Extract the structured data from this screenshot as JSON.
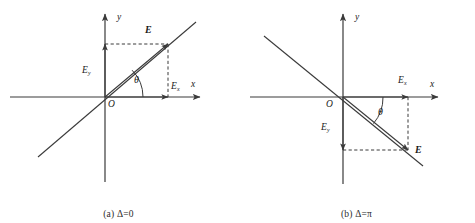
{
  "figure": {
    "stroke_color": "#3a3a3a",
    "panels": [
      {
        "id": "a",
        "caption": "(a) Δ=0",
        "axes": {
          "x_label": "x",
          "y_label": "y",
          "origin_label": "O"
        },
        "angle_label": "θ",
        "vector_label": "E",
        "component_x_label": "E",
        "component_x_sub": "x",
        "component_y_label": "E",
        "component_y_sub": "y",
        "line_slope": "positive",
        "e_vector_quadrant": "first"
      },
      {
        "id": "b",
        "caption": "(b) Δ=π",
        "axes": {
          "x_label": "x",
          "y_label": "y",
          "origin_label": "O"
        },
        "angle_label": "θ",
        "vector_label": "E",
        "component_x_label": "E",
        "component_x_sub": "x",
        "component_y_label": "E",
        "component_y_sub": "y",
        "line_slope": "negative",
        "e_vector_quadrant": "fourth"
      }
    ]
  }
}
